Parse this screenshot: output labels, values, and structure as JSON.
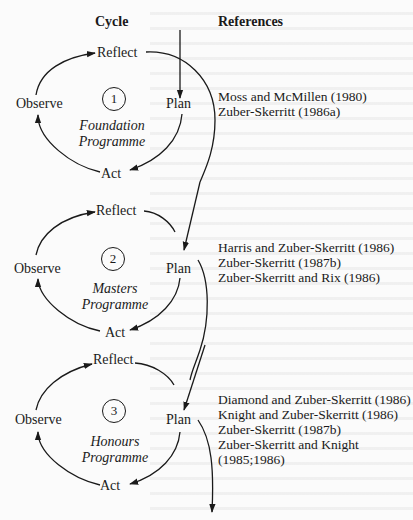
{
  "headers": {
    "cycle": "Cycle",
    "references": "References"
  },
  "cycles": [
    {
      "number": "1",
      "stages": {
        "reflect": "Reflect",
        "plan": "Plan",
        "act": "Act",
        "observe": "Observe"
      },
      "programme_line1": "Foundation",
      "programme_line2": "Programme",
      "references": [
        "Moss and McMillen (1980)",
        "Zuber-Skerritt (1986a)"
      ]
    },
    {
      "number": "2",
      "stages": {
        "reflect": "Reflect",
        "plan": "Plan",
        "act": "Act",
        "observe": "Observe"
      },
      "programme_line1": "Masters",
      "programme_line2": "Programme",
      "references": [
        "Harris and Zuber-Skerritt (1986)",
        "Zuber-Skerritt (1987b)",
        "Zuber-Skerritt and Rix (1986)"
      ]
    },
    {
      "number": "3",
      "stages": {
        "reflect": "Reflect",
        "plan": "Plan",
        "act": "Act",
        "observe": "Observe"
      },
      "programme_line1": "Honours",
      "programme_line2": "Programme",
      "references": [
        "Diamond and Zuber-Skerritt (1986)",
        "Knight and Zuber-Skerritt (1986)",
        "Zuber-Skerritt (1987b)",
        "Zuber-Skerritt and Knight",
        "(1985;1986)"
      ]
    }
  ],
  "colors": {
    "ink": "#1a1a1a",
    "paper": "#fbfbfb"
  }
}
